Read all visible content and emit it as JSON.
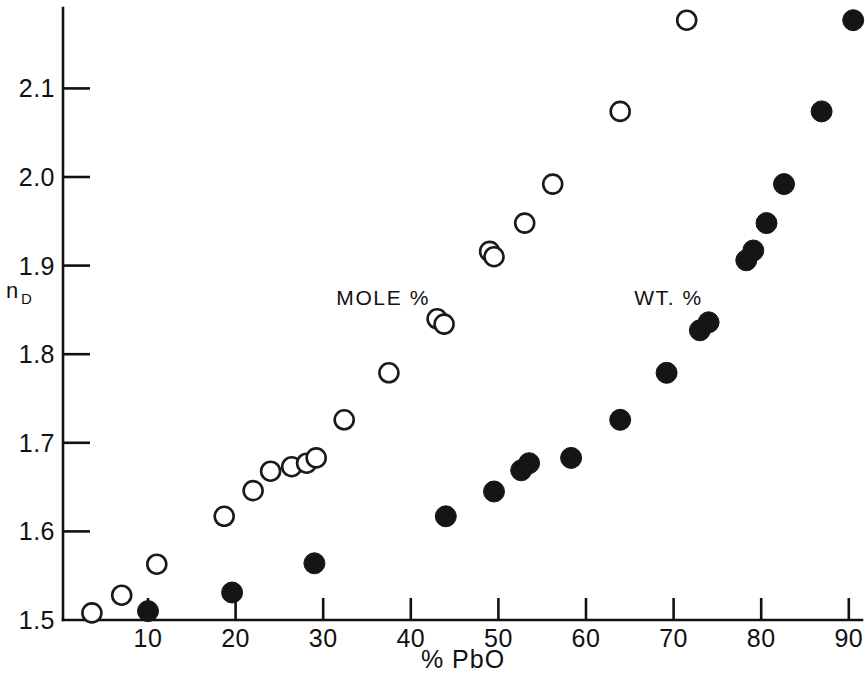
{
  "chart_data": {
    "type": "scatter",
    "title": "",
    "xlabel": "% PbO",
    "ylabel": "n_D",
    "ylabel_main": "n",
    "ylabel_sub": "D",
    "xlim": [
      0,
      92
    ],
    "ylim": [
      1.49,
      2.17
    ],
    "grid": false,
    "legend_position": "in-plot annotations",
    "xticks": [
      10,
      20,
      30,
      40,
      50,
      60,
      70,
      80,
      90
    ],
    "xtick_labels": [
      "10",
      "20",
      "30",
      "40",
      "50",
      "60",
      "70",
      "80",
      "90"
    ],
    "yticks": [
      1.5,
      1.6,
      1.7,
      1.8,
      1.9,
      2.0,
      2.1
    ],
    "ytick_labels": [
      "1.5",
      "1.6",
      "1.7",
      "1.8",
      "1.9",
      "2.0",
      "2.1"
    ],
    "annotations": [
      {
        "text": "MOLE %",
        "x": 31.5,
        "y": 1.855
      },
      {
        "text": "WT. %",
        "x": 65.5,
        "y": 1.855
      }
    ],
    "series": [
      {
        "name": "MOLE %",
        "marker": "open-circle",
        "color": "#1a1a1a",
        "points": [
          {
            "x": 3.6,
            "y": 1.508
          },
          {
            "x": 7.0,
            "y": 1.528
          },
          {
            "x": 11.0,
            "y": 1.563
          },
          {
            "x": 18.7,
            "y": 1.617
          },
          {
            "x": 22.0,
            "y": 1.646
          },
          {
            "x": 24.0,
            "y": 1.668
          },
          {
            "x": 26.4,
            "y": 1.673
          },
          {
            "x": 28.1,
            "y": 1.677
          },
          {
            "x": 29.2,
            "y": 1.683
          },
          {
            "x": 32.4,
            "y": 1.726
          },
          {
            "x": 37.5,
            "y": 1.779
          },
          {
            "x": 43.0,
            "y": 1.84
          },
          {
            "x": 43.8,
            "y": 1.834
          },
          {
            "x": 49.0,
            "y": 1.916
          },
          {
            "x": 49.5,
            "y": 1.91
          },
          {
            "x": 53.0,
            "y": 1.948
          },
          {
            "x": 56.2,
            "y": 1.992
          },
          {
            "x": 63.9,
            "y": 2.074
          },
          {
            "x": 71.5,
            "y": 2.177
          }
        ]
      },
      {
        "name": "WT. %",
        "marker": "filled-circle",
        "color": "#151515",
        "points": [
          {
            "x": 10.0,
            "y": 1.51
          },
          {
            "x": 19.6,
            "y": 1.531
          },
          {
            "x": 29.0,
            "y": 1.564
          },
          {
            "x": 44.0,
            "y": 1.617
          },
          {
            "x": 49.5,
            "y": 1.645
          },
          {
            "x": 52.6,
            "y": 1.669
          },
          {
            "x": 53.5,
            "y": 1.677
          },
          {
            "x": 58.3,
            "y": 1.683
          },
          {
            "x": 63.9,
            "y": 1.726
          },
          {
            "x": 69.2,
            "y": 1.779
          },
          {
            "x": 73.0,
            "y": 1.827
          },
          {
            "x": 74.0,
            "y": 1.836
          },
          {
            "x": 78.3,
            "y": 1.906
          },
          {
            "x": 79.1,
            "y": 1.917
          },
          {
            "x": 80.6,
            "y": 1.948
          },
          {
            "x": 82.6,
            "y": 1.992
          },
          {
            "x": 86.9,
            "y": 2.074
          },
          {
            "x": 90.5,
            "y": 2.177
          }
        ]
      }
    ]
  }
}
